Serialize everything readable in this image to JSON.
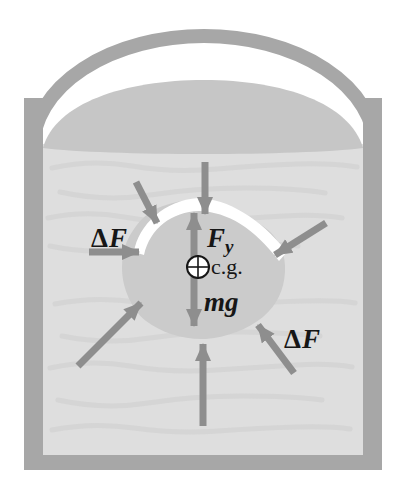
{
  "figure": {
    "labels": {
      "delta": "Δ",
      "force": "F",
      "buoyancy": {
        "symbol": "F",
        "subscript": "y"
      },
      "weight": "mg",
      "center_of_gravity": "c.g."
    },
    "colors": {
      "background": "#ffffff",
      "container": "#a7a7a7",
      "liquid_surface": "#c6c6c6",
      "liquid": "#dedede",
      "liquid_streak": "#d1d1d1",
      "object": "#cbcbcb",
      "highlight": "#ffffff",
      "arrow": "#8e8e8e",
      "text": "#161616"
    }
  }
}
